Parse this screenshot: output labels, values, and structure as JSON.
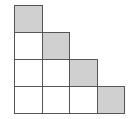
{
  "diagram": {
    "title": "",
    "type": "staircase-grid",
    "rows": 4,
    "cols": 4,
    "cell_size_px": 27.5,
    "colors": {
      "shaded": "#d0d0d0",
      "unshaded": "#ffffff",
      "border": "#555555"
    },
    "cells": [
      {
        "row": 0,
        "col": 0,
        "shaded": true
      },
      {
        "row": 1,
        "col": 0,
        "shaded": false
      },
      {
        "row": 1,
        "col": 1,
        "shaded": true
      },
      {
        "row": 2,
        "col": 0,
        "shaded": false
      },
      {
        "row": 2,
        "col": 1,
        "shaded": false
      },
      {
        "row": 2,
        "col": 2,
        "shaded": true
      },
      {
        "row": 3,
        "col": 0,
        "shaded": false
      },
      {
        "row": 3,
        "col": 1,
        "shaded": false
      },
      {
        "row": 3,
        "col": 2,
        "shaded": false
      },
      {
        "row": 3,
        "col": 3,
        "shaded": true
      }
    ],
    "total_squares": 10,
    "shaded_squares": 4
  }
}
